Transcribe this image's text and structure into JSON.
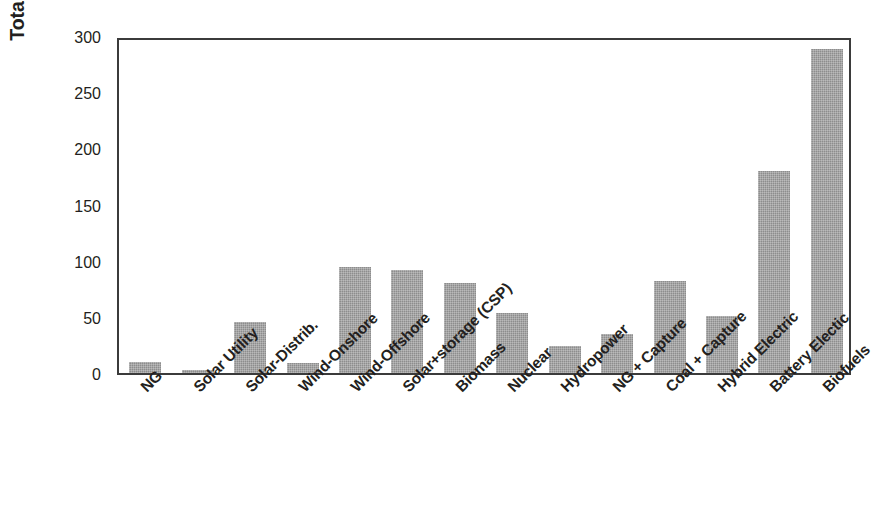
{
  "chart_data": {
    "type": "bar",
    "title": "",
    "xlabel": "",
    "ylabel": "Total cost ($/avoided CO2 ton)",
    "ylim": [
      0,
      300
    ],
    "yticks": [
      0,
      50,
      100,
      150,
      200,
      250,
      300
    ],
    "ytick_labels": [
      "0",
      "50",
      "100",
      "150",
      "200",
      "250",
      "300"
    ],
    "grid": false,
    "legend": null,
    "bar_color": "#8d8d8d",
    "axis_color": "#3b3b3b",
    "categories": [
      "NG",
      "Solar Utility",
      "Solar-Distrib.",
      "Wind-Onshore",
      "Wind-Offshore",
      "Solar+storage (CSP)",
      "Biomass",
      "Nuclear",
      "Hydropower",
      "NG + Capture",
      "Coal + Capture",
      "Hybrid Electric",
      "Battery Electic",
      "Biofuels"
    ],
    "values": [
      10,
      3,
      45,
      9,
      94,
      92,
      80,
      53,
      24,
      35,
      82,
      51,
      180,
      288
    ]
  }
}
